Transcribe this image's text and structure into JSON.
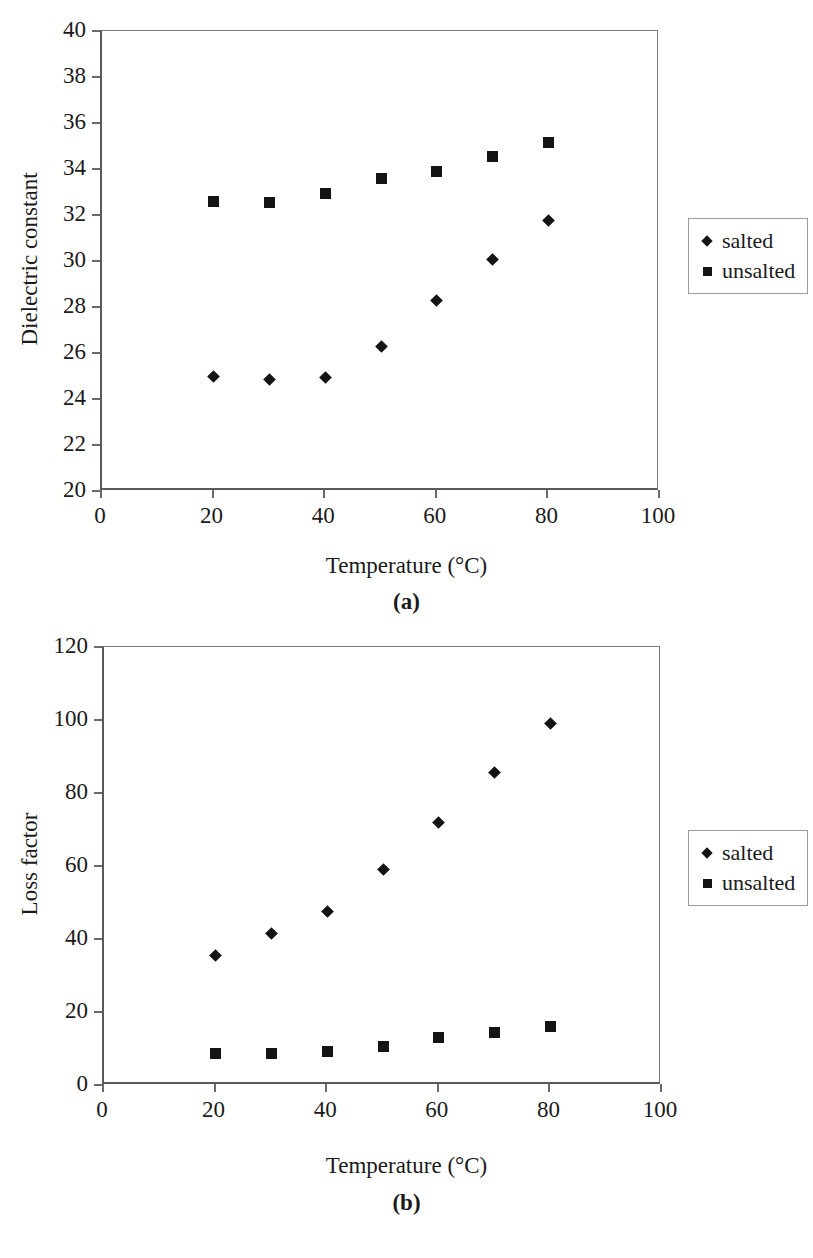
{
  "figure": {
    "panels": [
      {
        "caption": "(a)",
        "chart_data": {
          "type": "scatter",
          "title": "",
          "xlabel": "Temperature (°C)",
          "ylabel": "Dielectric constant",
          "xlim": [
            0,
            100
          ],
          "ylim": [
            20,
            40
          ],
          "xticks": [
            0,
            20,
            40,
            60,
            80,
            100
          ],
          "yticks": [
            20,
            22,
            24,
            26,
            28,
            30,
            32,
            34,
            36,
            38,
            40
          ],
          "xtick_labels": [
            "0",
            "20",
            "40",
            "60",
            "80",
            "100"
          ],
          "ytick_labels": [
            "20",
            "22",
            "24",
            "26",
            "28",
            "30",
            "32",
            "34",
            "36",
            "38",
            "40"
          ],
          "grid": false,
          "legend_position": "right",
          "x": [
            20,
            30,
            40,
            50,
            60,
            70,
            80
          ],
          "series": [
            {
              "name": "salted",
              "marker": "diamond",
              "color": "#141414",
              "values": [
                25.0,
                24.85,
                24.95,
                26.3,
                28.3,
                30.05,
                31.75
              ]
            },
            {
              "name": "unsalted",
              "marker": "square",
              "color": "#141414",
              "values": [
                32.6,
                32.55,
                32.95,
                33.6,
                33.9,
                34.55,
                35.15
              ]
            }
          ]
        }
      },
      {
        "caption": "(b)",
        "chart_data": {
          "type": "scatter",
          "title": "",
          "xlabel": "Temperature (°C)",
          "ylabel": "Loss factor",
          "xlim": [
            0,
            100
          ],
          "ylim": [
            0,
            120
          ],
          "xticks": [
            0,
            20,
            40,
            60,
            80,
            100
          ],
          "yticks": [
            0,
            20,
            40,
            60,
            80,
            100,
            120
          ],
          "xtick_labels": [
            "0",
            "20",
            "40",
            "60",
            "80",
            "100"
          ],
          "ytick_labels": [
            "0",
            "20",
            "40",
            "60",
            "80",
            "100",
            "120"
          ],
          "grid": false,
          "legend_position": "right",
          "x": [
            20,
            30,
            40,
            50,
            60,
            70,
            80
          ],
          "series": [
            {
              "name": "salted",
              "marker": "diamond",
              "color": "#141414",
              "values": [
                35.5,
                41.5,
                47.5,
                59.0,
                72.0,
                85.5,
                99.0
              ]
            },
            {
              "name": "unsalted",
              "marker": "square",
              "color": "#141414",
              "values": [
                8.5,
                8.5,
                9.3,
                10.5,
                13.0,
                14.3,
                16.0
              ]
            }
          ]
        }
      }
    ]
  }
}
